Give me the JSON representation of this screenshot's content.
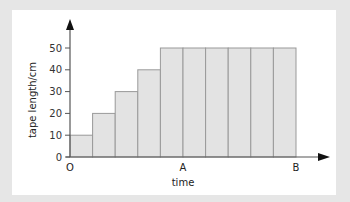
{
  "chart_data": {
    "type": "bar",
    "title": "",
    "xlabel": "time",
    "ylabel": "tape length/cm",
    "categories": [
      "1",
      "2",
      "3",
      "4",
      "5",
      "6",
      "7",
      "8",
      "9",
      "10"
    ],
    "values": [
      10,
      20,
      30,
      40,
      50,
      50,
      50,
      50,
      50,
      50
    ],
    "ylim": [
      0,
      55
    ],
    "yticks": [
      0,
      10,
      20,
      30,
      40,
      50
    ],
    "x_markers": [
      {
        "label": "O",
        "position": 0
      },
      {
        "label": "A",
        "position": 5
      },
      {
        "label": "B",
        "position": 10
      }
    ],
    "grid": false,
    "legend": null,
    "bar_color": "#e3e3e3",
    "bar_edge_color": "#999999"
  }
}
